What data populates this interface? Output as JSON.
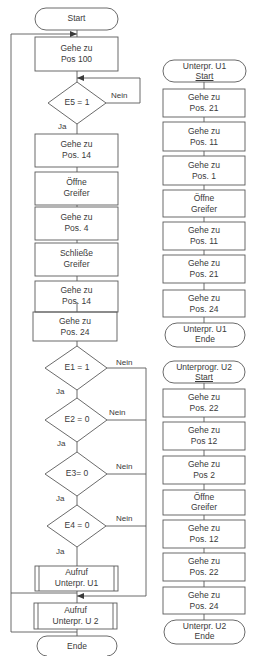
{
  "main_flow": {
    "start": "Start",
    "steps": [
      {
        "line1": "Gehe zu",
        "line2": "Pos 100"
      },
      {
        "line1": "Gehe zu",
        "line2": "Pos. 14"
      },
      {
        "line1": "Öffne",
        "line2": "Greifer"
      },
      {
        "line1": "Gehe zu",
        "line2": "Pos. 4"
      },
      {
        "line1": "Schließe",
        "line2": "Greifer"
      },
      {
        "line1": "Gehe zu",
        "line2": "Pos. 14"
      },
      {
        "line1": "Gehe zu",
        "line2": "Pos. 24"
      }
    ],
    "decisions": [
      {
        "condition": "E5 = 1",
        "yes": "Ja",
        "no": "Nein"
      },
      {
        "condition": "E1 = 1",
        "yes": "Ja",
        "no": "Nein"
      },
      {
        "condition": "E2 = 0",
        "yes": "Ja",
        "no": "Nein"
      },
      {
        "condition": "E3= 0",
        "yes": "Ja",
        "no": "Nein"
      },
      {
        "condition": "E4 = 0",
        "yes": "Ja",
        "no": "Nein"
      }
    ],
    "calls": [
      {
        "line1": "Aufruf",
        "line2": "Unterpr. U1"
      },
      {
        "line1": "Aufruf",
        "line2": "Unterpr. U 2"
      }
    ],
    "end": "Ende"
  },
  "subroutine_u1": {
    "start": {
      "line1": "Unterpr. U1",
      "line2": "Start"
    },
    "steps": [
      {
        "line1": "Gehe zu",
        "line2": "Pos. 21"
      },
      {
        "line1": "Gehe zu",
        "line2": "Pos. 11"
      },
      {
        "line1": "Gehe zu",
        "line2": "Pos. 1"
      },
      {
        "line1": "Öffne",
        "line2": "Greifer"
      },
      {
        "line1": "Gehe zu",
        "line2": "Pos. 11"
      },
      {
        "line1": "Gehe zu",
        "line2": "Pos. 21"
      },
      {
        "line1": "Gehe zu",
        "line2": "Pos. 24"
      }
    ],
    "end": {
      "line1": "Unterpr. U1",
      "line2": "Ende"
    }
  },
  "subroutine_u2": {
    "start": {
      "line1": "Unterprogr. U2",
      "line2": "Start"
    },
    "steps": [
      {
        "line1": "Gehe zu",
        "line2": "Pos. 22"
      },
      {
        "line1": "Gehe zu",
        "line2": "Pos 12"
      },
      {
        "line1": "Gehe zu",
        "line2": "Pos 2"
      },
      {
        "line1": "Öffne",
        "line2": "Greifer"
      },
      {
        "line1": "Gehe zu",
        "line2": "Pos. 12"
      },
      {
        "line1": "Gehe zu",
        "line2": "Pos. 22"
      },
      {
        "line1": "Gehe zu",
        "line2": "Pos. 24"
      }
    ],
    "end": {
      "line1": "Unterpr. U2",
      "line2": "Ende"
    }
  },
  "colors": {
    "line": "#5a5a5a",
    "text": "#3a3a3a",
    "background": "#ffffff"
  }
}
